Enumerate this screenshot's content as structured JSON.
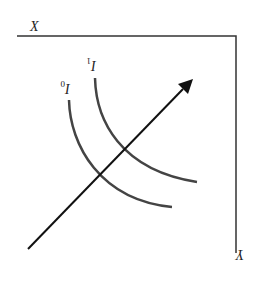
{
  "diagram": {
    "type": "indifference-curve-diagram-rotated-180",
    "axes": {
      "x_label": "X",
      "y_label": "Y"
    },
    "curves": [
      {
        "name": "I0",
        "label": "I",
        "subscript": "0"
      },
      {
        "name": "I1",
        "label": "I",
        "subscript": "1"
      }
    ],
    "arrow": {
      "direction": "up-right"
    },
    "colors": {
      "axis": "#333333",
      "curve": "#444444",
      "arrow": "#111111"
    }
  }
}
